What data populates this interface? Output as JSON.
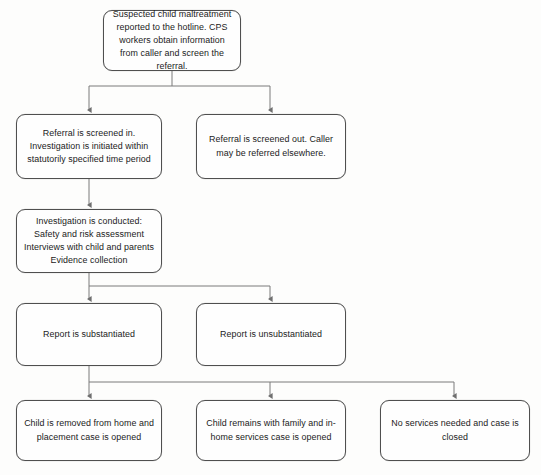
{
  "diagram": {
    "line_color": "#7a7a7a",
    "box_border_color": "#4f4f4f",
    "background_color": "#fdfdfc",
    "text_color": "#1b1b1b",
    "nodes": [
      {
        "id": "report-intake",
        "text": "Suspected child maltreatment reported to the hotline.  CPS workers obtain information from caller and screen the referral."
      },
      {
        "id": "screened-in",
        "text": "Referral is screened in. Investigation is initiated within statutorily specified time period"
      },
      {
        "id": "screened-out",
        "text": "Referral is screened out.  Caller may be referred elsewhere."
      },
      {
        "id": "investigation",
        "text": "Investigation is conducted:\nSafety and risk assessment\nInterviews with child and parents\nEvidence collection"
      },
      {
        "id": "substantiated",
        "text": "Report is substantiated"
      },
      {
        "id": "unsubstantiated",
        "text": "Report is unsubstantiated"
      },
      {
        "id": "removed",
        "text": "Child is removed from home and placement case is opened"
      },
      {
        "id": "in-home",
        "text": "Child remains with family and in-home services case is opened"
      },
      {
        "id": "closed",
        "text": "No services needed and case is closed"
      }
    ],
    "edges": [
      {
        "from": "report-intake",
        "to": "screened-in"
      },
      {
        "from": "report-intake",
        "to": "screened-out"
      },
      {
        "from": "screened-in",
        "to": "investigation"
      },
      {
        "from": "investigation",
        "to": "substantiated"
      },
      {
        "from": "investigation",
        "to": "unsubstantiated"
      },
      {
        "from": "substantiated",
        "to": "removed"
      },
      {
        "from": "substantiated",
        "to": "in-home"
      },
      {
        "from": "substantiated",
        "to": "closed"
      }
    ]
  }
}
